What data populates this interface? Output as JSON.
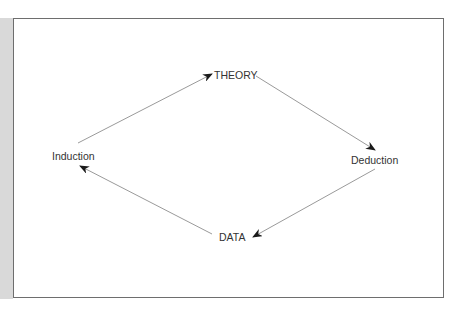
{
  "diagram": {
    "nodes": [
      {
        "id": "theory",
        "label": "THEORY"
      },
      {
        "id": "deduction",
        "label": "Deduction"
      },
      {
        "id": "data",
        "label": "DATA"
      },
      {
        "id": "induction",
        "label": "Induction"
      }
    ],
    "edges": [
      {
        "from": "Induction",
        "to": "THEORY"
      },
      {
        "from": "THEORY",
        "to": "Deduction"
      },
      {
        "from": "Deduction",
        "to": "DATA"
      },
      {
        "from": "DATA",
        "to": "Induction"
      }
    ],
    "colors": {
      "line": "#9a9a9a",
      "arrowhead": "#1a1a1a",
      "frame": "#6e6e6e",
      "strip": "#d9d9d9"
    }
  }
}
